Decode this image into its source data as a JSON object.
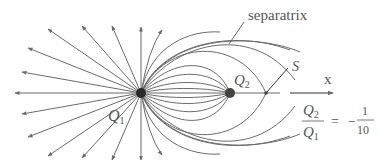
{
  "diagram": {
    "type": "electric field lines of two point charges",
    "labels": {
      "separatrix": "separatrix",
      "q1": "Q",
      "q1_sub": "1",
      "q2": "Q",
      "q2_sub": "2",
      "saddle": "S",
      "axis": "x"
    },
    "ratio": {
      "num": "Q",
      "num_sub": "2",
      "den": "Q",
      "den_sub": "1",
      "equals": "=",
      "minus": "−",
      "value_num": "1",
      "value_den": "10"
    },
    "colors": {
      "line": "#6a6a6a",
      "charge": "#2a2a2a",
      "text": "#555555"
    }
  }
}
